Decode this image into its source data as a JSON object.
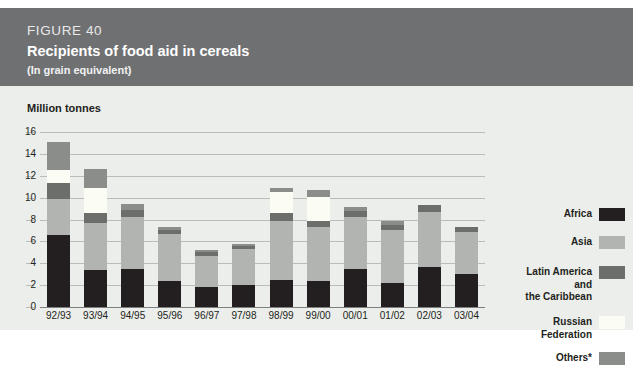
{
  "figure": {
    "number": "FIGURE 40",
    "title": "Recipients of food aid in cereals",
    "subtitle": "(In grain equivalent)"
  },
  "colors": {
    "header_band": "#6f7072",
    "panel_background": "#eceeeb",
    "africa": "#231f20",
    "asia": "#b2b4b1",
    "latin_america": "#6c6e6c",
    "russian_federation": "#fbfcf3",
    "others": "#8b8d8a",
    "gridline": "#b9bcb8",
    "text": "#231f20"
  },
  "chart_data": {
    "type": "bar",
    "title": "Recipients of food aid in cereals",
    "subtitle": "(In grain equivalent)",
    "stacked": true,
    "xlabel": "",
    "ylabel": "Million tonnes",
    "ylim": [
      0,
      16
    ],
    "yticks": [
      0,
      2,
      4,
      6,
      8,
      10,
      12,
      14,
      16
    ],
    "ytick_labels": [
      "0",
      "2",
      "4",
      "6",
      "8",
      "10",
      "12",
      "14",
      "16"
    ],
    "grid": true,
    "legend_position": "right",
    "categories": [
      "92/93",
      "93/94",
      "94/95",
      "95/96",
      "96/97",
      "97/98",
      "98/99",
      "99/00",
      "00/01",
      "01/02",
      "02/03",
      "03/04"
    ],
    "series": [
      {
        "name": "Africa",
        "color": "#231f20",
        "values": [
          6.6,
          3.4,
          3.5,
          2.4,
          1.8,
          2.0,
          2.5,
          2.4,
          3.5,
          2.2,
          3.7,
          3.0
        ]
      },
      {
        "name": "Asia",
        "color": "#b2b4b1",
        "values": [
          3.3,
          4.3,
          4.7,
          4.3,
          2.9,
          3.3,
          5.4,
          4.9,
          4.7,
          4.8,
          5.0,
          3.9
        ]
      },
      {
        "name": "Latin America and the Caribbean",
        "color": "#6c6e6c",
        "values": [
          1.4,
          0.9,
          0.7,
          0.3,
          0.3,
          0.3,
          0.7,
          0.6,
          0.6,
          0.5,
          0.6,
          0.4
        ]
      },
      {
        "name": "Russian Federation",
        "color": "#fbfcf3",
        "values": [
          1.2,
          2.3,
          0.0,
          0.0,
          0.0,
          0.0,
          1.9,
          2.2,
          0.0,
          0.0,
          0.0,
          0.0
        ]
      },
      {
        "name": "Others*",
        "color": "#8b8d8a",
        "values": [
          2.6,
          1.7,
          0.5,
          0.3,
          0.2,
          0.2,
          0.4,
          0.6,
          0.3,
          0.4,
          0.0,
          0.0
        ]
      }
    ],
    "totals": [
      15.1,
      12.6,
      9.4,
      7.3,
      5.2,
      5.8,
      10.9,
      10.7,
      9.1,
      7.9,
      9.3,
      7.3
    ]
  },
  "axis": {
    "unit_label": "Million tonnes"
  },
  "legend": {
    "items": [
      {
        "label": "Africa",
        "swatch_class": "sw-africa",
        "name": "legend-swatch-africa"
      },
      {
        "label": "Asia",
        "swatch_class": "sw-asia",
        "name": "legend-swatch-asia"
      },
      {
        "label": "Latin America\nand\nthe Caribbean",
        "swatch_class": "sw-latam",
        "name": "legend-swatch-latin-america"
      },
      {
        "label": "Russian\nFederation",
        "swatch_class": "sw-russia",
        "name": "legend-swatch-russian-federation"
      },
      {
        "label": "Others*",
        "swatch_class": "sw-others",
        "name": "legend-swatch-others"
      }
    ]
  }
}
